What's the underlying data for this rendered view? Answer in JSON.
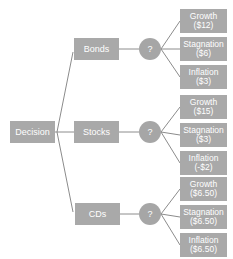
{
  "colors": {
    "box": "#a9a9a9",
    "chance": "#a6a6a6",
    "line": "#8c8c8c",
    "text": "#ffffff"
  },
  "root": {
    "label": "Decision"
  },
  "options": [
    {
      "label": "Bonds",
      "chance_label": "?",
      "outcomes": [
        {
          "label": "Growth",
          "value": "($12)"
        },
        {
          "label": "Stagnation",
          "value": "($6)"
        },
        {
          "label": "Inflation",
          "value": "($3)"
        }
      ]
    },
    {
      "label": "Stocks",
      "chance_label": "?",
      "outcomes": [
        {
          "label": "Growth",
          "value": "($15)"
        },
        {
          "label": "Stagnation",
          "value": "($3)"
        },
        {
          "label": "Inflation",
          "value": "(-$2)"
        }
      ]
    },
    {
      "label": "CDs",
      "chance_label": "?",
      "outcomes": [
        {
          "label": "Growth",
          "value": "($6.50)"
        },
        {
          "label": "Stagnation",
          "value": "($6.50)"
        },
        {
          "label": "Inflation",
          "value": "($6.50)"
        }
      ]
    }
  ]
}
